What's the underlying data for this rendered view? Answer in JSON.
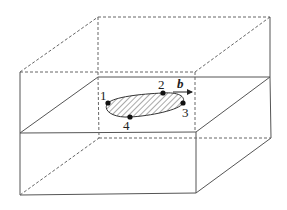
{
  "diagram": {
    "colors": {
      "line": "#555555",
      "point": "#111111",
      "hatch": "#555555"
    },
    "labels": {
      "point_1": "1",
      "point_2": "2",
      "point_3": "3",
      "point_4": "4",
      "burgers_vector": "b"
    },
    "elements": [
      "upper crystal block (dashed hidden edges)",
      "slip plane (solid parallelogram)",
      "lower crystal block (solid box)",
      "hatched elliptical slipped area",
      "Burgers vector arrow b"
    ]
  }
}
